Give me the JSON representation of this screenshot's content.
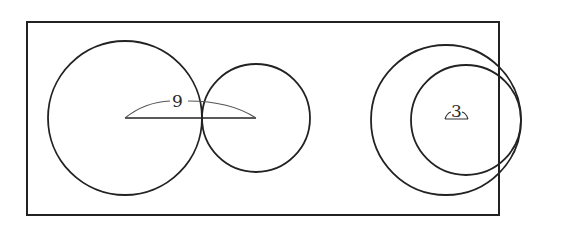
{
  "figure": {
    "stroke_color": "#222222",
    "background": "#ffffff",
    "frame": {
      "x": 27,
      "y": 22,
      "width": 472,
      "height": 193
    },
    "left_group": {
      "circle_large": {
        "cx": 125,
        "cy": 118,
        "r": 77
      },
      "circle_small": {
        "cx": 256,
        "cy": 118,
        "r": 54
      },
      "center_distance_label": "9",
      "segment": {
        "x1": 125,
        "y1": 118,
        "x2": 256,
        "y2": 118
      }
    },
    "right_group": {
      "circle_large": {
        "cx": 446,
        "cy": 120,
        "r": 75
      },
      "circle_small": {
        "cx": 466,
        "cy": 120,
        "r": 55
      },
      "center_distance_label": "3"
    }
  }
}
